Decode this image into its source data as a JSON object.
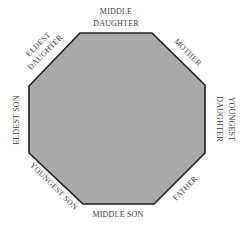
{
  "diagram": {
    "shape": "octagon",
    "fill_color": "#a9a9a9",
    "stroke_color": "#1e1e1e",
    "text_color": "#3a3a3a",
    "labels": {
      "top_line1": "MIDDLE",
      "top_line2": "DAUGHTER",
      "top_right": "MOTHER",
      "right_line1": "YOUNGEST",
      "right_line2": "DAUGHTER",
      "bottom_right": "FATHER",
      "bottom": "MIDDLE SON",
      "bottom_left": "YOUNGEST SON",
      "left": "ELDEST SON",
      "top_left_line1": "ELDEST",
      "top_left_line2": "DAUGHTER"
    }
  }
}
